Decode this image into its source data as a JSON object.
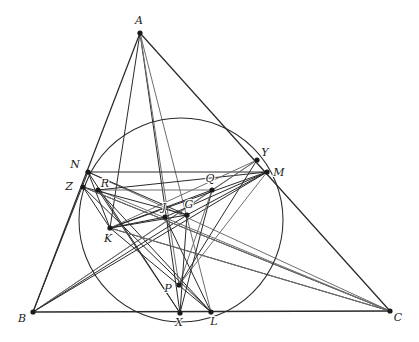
{
  "figure": {
    "canvas": {
      "width": 419,
      "height": 342
    },
    "background_color": "#ffffff",
    "stroke_dark": "#2a2a2a",
    "stroke_gray": "#6e6e6e",
    "vertex_color": "#1a1a1a"
  },
  "points": [
    {
      "id": "A",
      "label": "A",
      "x": 140,
      "y": 33,
      "label_dx": -1,
      "label_dy": -9,
      "anchor": "middle"
    },
    {
      "id": "B",
      "label": "B",
      "x": 33,
      "y": 312,
      "label_dx": -11,
      "label_dy": 10,
      "anchor": "middle"
    },
    {
      "id": "C",
      "label": "C",
      "x": 390,
      "y": 311,
      "label_dx": 8,
      "label_dy": 10,
      "anchor": "middle"
    },
    {
      "id": "N",
      "label": "N",
      "x": 88,
      "y": 172,
      "label_dx": -13,
      "label_dy": -4,
      "anchor": "middle"
    },
    {
      "id": "Z",
      "label": "Z",
      "x": 83,
      "y": 187,
      "label_dx": -14,
      "label_dy": 3,
      "anchor": "middle"
    },
    {
      "id": "R",
      "label": "R",
      "x": 98,
      "y": 190,
      "label_dx": 7,
      "label_dy": -3,
      "anchor": "middle"
    },
    {
      "id": "K",
      "label": "K",
      "x": 110,
      "y": 228,
      "label_dx": -2,
      "label_dy": 14,
      "anchor": "middle"
    },
    {
      "id": "Y",
      "label": "Y",
      "x": 257,
      "y": 160,
      "label_dx": 8,
      "label_dy": -4,
      "anchor": "middle"
    },
    {
      "id": "M",
      "label": "M",
      "x": 267,
      "y": 172,
      "label_dx": 12,
      "label_dy": 4,
      "anchor": "middle"
    },
    {
      "id": "Q",
      "label": "Q",
      "x": 212,
      "y": 190,
      "label_dx": -2,
      "label_dy": -8,
      "anchor": "middle"
    },
    {
      "id": "J",
      "label": "J",
      "x": 165,
      "y": 217,
      "label_dx": -1,
      "label_dy": -6,
      "anchor": "middle"
    },
    {
      "id": "G",
      "label": "G",
      "x": 187,
      "y": 215,
      "label_dx": 2,
      "label_dy": -7,
      "anchor": "middle"
    },
    {
      "id": "P",
      "label": "P",
      "x": 179,
      "y": 285,
      "label_dx": -11,
      "label_dy": 7,
      "anchor": "middle"
    },
    {
      "id": "X",
      "label": "X",
      "x": 180,
      "y": 313,
      "label_dx": -1,
      "label_dy": 13,
      "anchor": "middle"
    },
    {
      "id": "L",
      "label": "L",
      "x": 211,
      "y": 312,
      "label_dx": 3,
      "label_dy": 13,
      "anchor": "middle"
    }
  ],
  "circle": {
    "name": "conic-through-N-Y-M-R-Q-P-X-L",
    "cx": 181,
    "cy": 220,
    "r": 102,
    "stroke": "#2a2a2a",
    "stroke_width": 1.05,
    "fill": "none"
  },
  "segments": [
    {
      "name": "side-AB",
      "from": "A",
      "to": "B",
      "shade": "dark",
      "width": 1.25
    },
    {
      "name": "side-AC",
      "from": "A",
      "to": "C",
      "shade": "dark",
      "width": 1.25
    },
    {
      "name": "side-BC",
      "from": "B",
      "to": "C",
      "shade": "dark",
      "width": 1.35
    },
    {
      "name": "cevian-A-X",
      "from": "A",
      "to": "X",
      "shade": "dark",
      "width": 1.0
    },
    {
      "name": "cevian-A-L",
      "from": "A",
      "to": "L",
      "shade": "gray",
      "width": 1.0
    },
    {
      "name": "cevian-A-P",
      "from": "A",
      "to": "P",
      "shade": "gray",
      "width": 1.0
    },
    {
      "name": "cevian-A-K",
      "from": "A",
      "to": "K",
      "shade": "dark",
      "width": 1.0
    },
    {
      "name": "cevian-B-M",
      "from": "B",
      "to": "M",
      "shade": "dark",
      "width": 1.0
    },
    {
      "name": "cevian-B-Y",
      "from": "B",
      "to": "Y",
      "shade": "gray",
      "width": 1.0
    },
    {
      "name": "cevian-B-Q",
      "from": "B",
      "to": "Q",
      "shade": "gray",
      "width": 1.0
    },
    {
      "name": "cevian-B-G",
      "from": "B",
      "to": "G",
      "shade": "dark",
      "width": 1.0
    },
    {
      "name": "line-B-N",
      "from": "B",
      "to": "N",
      "shade": "dark",
      "width": 1.0
    },
    {
      "name": "cevian-C-Z",
      "from": "C",
      "to": "Z",
      "shade": "dark",
      "width": 1.0
    },
    {
      "name": "cevian-C-N",
      "from": "C",
      "to": "N",
      "shade": "gray",
      "width": 1.0
    },
    {
      "name": "cevian-C-R",
      "from": "C",
      "to": "R",
      "shade": "gray",
      "width": 1.0
    },
    {
      "name": "cevian-C-K",
      "from": "C",
      "to": "K",
      "shade": "dark",
      "width": 1.0
    },
    {
      "name": "chord-N-M",
      "from": "N",
      "to": "M",
      "shade": "dark",
      "width": 1.0
    },
    {
      "name": "chord-R-Q",
      "from": "R",
      "to": "Q",
      "shade": "gray",
      "width": 1.0
    },
    {
      "name": "chord-R-M",
      "from": "R",
      "to": "M",
      "shade": "dark",
      "width": 1.0
    },
    {
      "name": "chord-K-Q",
      "from": "K",
      "to": "Q",
      "shade": "dark",
      "width": 1.0
    },
    {
      "name": "chord-K-M",
      "from": "K",
      "to": "M",
      "shade": "dark",
      "width": 1.0
    },
    {
      "name": "chord-K-Y",
      "from": "K",
      "to": "Y",
      "shade": "gray",
      "width": 1.0
    },
    {
      "name": "chord-K-L",
      "from": "K",
      "to": "L",
      "shade": "dark",
      "width": 1.0
    },
    {
      "name": "chord-K-G",
      "from": "K",
      "to": "G",
      "shade": "dark",
      "width": 1.2
    },
    {
      "name": "chord-K-J",
      "from": "K",
      "to": "J",
      "shade": "dark",
      "width": 1.2
    },
    {
      "name": "chord-Z-K",
      "from": "Z",
      "to": "K",
      "shade": "dark",
      "width": 1.0
    },
    {
      "name": "chord-N-K",
      "from": "N",
      "to": "K",
      "shade": "dark",
      "width": 1.0
    },
    {
      "name": "chord-Q-X",
      "from": "Q",
      "to": "X",
      "shade": "dark",
      "width": 1.0
    },
    {
      "name": "chord-Q-P",
      "from": "Q",
      "to": "P",
      "shade": "gray",
      "width": 1.0
    },
    {
      "name": "chord-Y-Q",
      "from": "Y",
      "to": "Q",
      "shade": "gray",
      "width": 1.0
    },
    {
      "name": "chord-N-G",
      "from": "N",
      "to": "G",
      "shade": "dark",
      "width": 1.0
    },
    {
      "name": "chord-Z-G",
      "from": "Z",
      "to": "G",
      "shade": "dark",
      "width": 1.0
    },
    {
      "name": "chord-J-M",
      "from": "J",
      "to": "M",
      "shade": "dark",
      "width": 1.0
    },
    {
      "name": "chord-G-M",
      "from": "G",
      "to": "M",
      "shade": "dark",
      "width": 1.0
    },
    {
      "name": "chord-P-Y",
      "from": "P",
      "to": "Y",
      "shade": "dark",
      "width": 1.0
    },
    {
      "name": "chord-P-M",
      "from": "P",
      "to": "M",
      "shade": "gray",
      "width": 1.0
    },
    {
      "name": "chord-R-L",
      "from": "R",
      "to": "L",
      "shade": "dark",
      "width": 1.0
    },
    {
      "name": "chord-Z-L",
      "from": "Z",
      "to": "L",
      "shade": "dark",
      "width": 1.0
    },
    {
      "name": "chord-N-X",
      "from": "N",
      "to": "X",
      "shade": "dark",
      "width": 1.0
    },
    {
      "name": "chord-R-X",
      "from": "R",
      "to": "X",
      "shade": "dark",
      "width": 1.0
    },
    {
      "name": "chord-J-L",
      "from": "J",
      "to": "L",
      "shade": "dark",
      "width": 1.0
    },
    {
      "name": "chord-G-X",
      "from": "G",
      "to": "X",
      "shade": "dark",
      "width": 1.0
    },
    {
      "name": "chord-Z-C-upper",
      "from": "Z",
      "to": "C",
      "shade": "gray",
      "width": 1.0
    },
    {
      "name": "chord-K-C-lower",
      "from": "K",
      "to": "C",
      "shade": "gray",
      "width": 1.0
    }
  ],
  "vertex_dot": {
    "radius": 2.6,
    "color": "#1a1a1a"
  }
}
